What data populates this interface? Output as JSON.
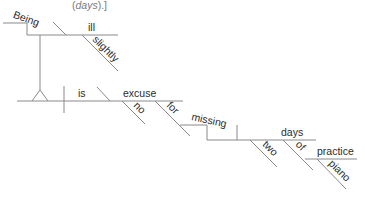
{
  "caption": {
    "open": "(",
    "italic": "days",
    "close": ").]"
  },
  "diagram": {
    "type": "reed-kellogg sentence diagram",
    "line_color": "#8a8a8a",
    "text_color": "#2a2a2a",
    "caption_color": "#7a7a7a",
    "words": {
      "gerund": "Being",
      "gerund_complement": "ill",
      "gerund_modifier": "slightly",
      "verb": "is",
      "predicate_noun": "excuse",
      "predicate_modifier": "no",
      "preposition_for": "for",
      "gerund_object_phrase": "missing",
      "object": "days",
      "object_modifier": "two",
      "preposition_of": "of",
      "prep_object": "practice",
      "prep_object_modifier": "piano"
    }
  }
}
